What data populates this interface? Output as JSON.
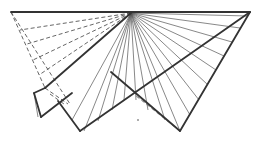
{
  "diagram": {
    "title": "",
    "colors": {
      "line": "#333333",
      "thin_line": "#555555",
      "background": "#ffffff"
    },
    "apex": [
      131,
      13
    ],
    "outline_top_left": [
      11,
      12
    ],
    "outline_top_right": [
      250,
      12
    ],
    "bottom_mid_vertex": [
      80,
      131
    ],
    "bottom_right_vertex": [
      180,
      131
    ],
    "flap_top": [
      34,
      93
    ],
    "flap_bottom": [
      41,
      117
    ],
    "flap_inner": [
      45,
      88
    ]
  }
}
